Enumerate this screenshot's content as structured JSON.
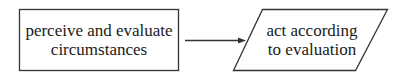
{
  "diagram": {
    "type": "flowchart",
    "nodes": [
      {
        "id": "perceive",
        "shape": "rectangle",
        "lines": [
          "perceive and evaluate",
          "circumstances"
        ]
      },
      {
        "id": "act",
        "shape": "parallelogram",
        "lines": [
          "act according",
          "to evaluation"
        ]
      }
    ],
    "edges": [
      {
        "from": "perceive",
        "to": "act",
        "style": "arrow"
      }
    ],
    "colors": {
      "stroke": "#333333",
      "text": "#1a1a1a",
      "background": "#ffffff"
    }
  }
}
